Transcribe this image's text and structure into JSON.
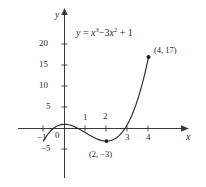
{
  "figure": {
    "background_color": "#ffffff",
    "stroke_color": "#2b2b2b"
  },
  "chart_data": {
    "type": "line",
    "title": "",
    "equation_text": "y = x³ − 3x² + 1",
    "equation": {
      "lhs": "y",
      "eq": "=",
      "term1_base": "x",
      "term1_exp": "3",
      "minus": "−",
      "term2_coef": "3",
      "term2_base": "x",
      "term2_exp": "2",
      "plus": "+",
      "constant": "1"
    },
    "xlabel": "x",
    "ylabel": "y",
    "xlim": [
      -1.6,
      5.1
    ],
    "ylim": [
      -8,
      23
    ],
    "grid": false,
    "legend": null,
    "xticks": [
      {
        "value": -1,
        "label": "−1",
        "position": "below"
      },
      {
        "value": 0,
        "label": "0",
        "position": "below-left"
      },
      {
        "value": 1,
        "label": "1",
        "position": "above"
      },
      {
        "value": 2,
        "label": "2",
        "position": "above"
      },
      {
        "value": 3,
        "label": "3",
        "position": "below"
      },
      {
        "value": 4,
        "label": "4",
        "position": "below"
      }
    ],
    "yticks": [
      {
        "value": -5,
        "label": "−5"
      },
      {
        "value": 5,
        "label": "5"
      },
      {
        "value": 10,
        "label": "10"
      },
      {
        "value": 15,
        "label": "15"
      },
      {
        "value": 20,
        "label": "20"
      }
    ],
    "x": [
      -1.0,
      -0.9,
      -0.8,
      -0.7,
      -0.6,
      -0.5,
      -0.4,
      -0.3,
      -0.2,
      -0.1,
      0.0,
      0.1,
      0.2,
      0.3,
      0.4,
      0.5,
      0.6,
      0.7,
      0.8,
      0.9,
      1.0,
      1.1,
      1.2,
      1.3,
      1.4,
      1.5,
      1.6,
      1.7,
      1.8,
      1.9,
      2.0,
      2.1,
      2.2,
      2.3,
      2.4,
      2.5,
      2.6,
      2.7,
      2.8,
      2.9,
      3.0,
      3.1,
      3.2,
      3.3,
      3.4,
      3.5,
      3.6,
      3.7,
      3.8,
      3.9,
      4.0
    ],
    "y": [
      -3.0,
      -2.16,
      -1.43,
      -0.81,
      -0.3,
      0.13,
      0.46,
      0.7,
      0.87,
      0.97,
      1.0,
      0.97,
      0.89,
      0.76,
      0.58,
      0.38,
      0.14,
      -0.13,
      -0.41,
      -0.7,
      -1.0,
      -1.3,
      -1.59,
      -1.87,
      -2.14,
      -2.38,
      -2.59,
      -2.76,
      -2.89,
      -2.97,
      -3.0,
      -2.97,
      -2.87,
      -2.7,
      -2.46,
      -2.13,
      -1.7,
      -1.19,
      -0.57,
      0.16,
      1.0,
      1.96,
      3.05,
      4.27,
      5.62,
      7.13,
      8.78,
      10.58,
      12.55,
      14.68,
      17.0
    ],
    "annotated_points": [
      {
        "x": 2,
        "y": -3,
        "label": "(2, −3)",
        "label_position": "below",
        "marker": "dot"
      },
      {
        "x": 4,
        "y": 17,
        "label": "(4, 17)",
        "label_position": "upper-right",
        "marker": "dot"
      }
    ],
    "curve_domain": [
      -1.0,
      4.0
    ],
    "local_maximum": {
      "x": 0,
      "y": 1
    },
    "local_minimum": {
      "x": 2,
      "y": -3
    },
    "x_intercepts_visible": [
      -0.53,
      0.65,
      2.88
    ]
  }
}
